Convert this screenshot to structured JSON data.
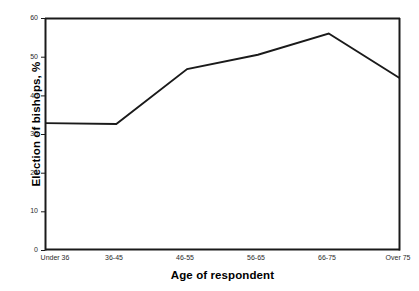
{
  "chart_data": {
    "type": "line",
    "title": "",
    "xlabel": "Age of respondent",
    "ylabel": "Election of bishops, %",
    "categories": [
      "Under 36",
      "36-45",
      "46-55",
      "56-65",
      "66-75",
      "Over 75"
    ],
    "values": [
      32.8,
      32.6,
      46.8,
      50.5,
      56.0,
      44.5
    ],
    "series": [
      {
        "name": "Election of bishops",
        "values": [
          32.8,
          32.6,
          46.8,
          50.5,
          56.0,
          44.5
        ]
      }
    ],
    "ylim": [
      0,
      60
    ],
    "yticks": [
      0,
      10,
      20,
      30,
      40,
      50,
      60
    ],
    "ytick_labels": [
      "0",
      "10",
      "20",
      "30",
      "40",
      "50",
      "60"
    ],
    "xtick_labels": [
      "Under 36",
      "36-45",
      "46-55",
      "56-65",
      "66-75",
      "Over 75"
    ],
    "grid": false,
    "legend": false,
    "legend_position": "none",
    "line_color": "#1a1a1a",
    "axis_color": "#1a1a1a",
    "background_color": "#ffffff",
    "annotations": []
  },
  "caption": {
    "text": ""
  }
}
